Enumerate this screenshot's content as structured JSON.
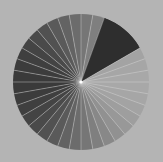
{
  "image": {
    "description": "Grayscale radial dial with thin white spokes and a dark highlighted wedge",
    "background": "#b4b4b4",
    "dial": {
      "cx": 81,
      "cy": 82,
      "r": 68,
      "segments": 36,
      "spoke_color": "#d8d8d8",
      "center_dot_color": "#ffffff",
      "gradient": {
        "start_angle_deg": 0,
        "light": "#a8a8a8",
        "dark": "#3a3a3a"
      },
      "highlight_wedge": {
        "from_deg": 20,
        "to_deg": 58,
        "color": "#2e2e2e"
      }
    }
  }
}
